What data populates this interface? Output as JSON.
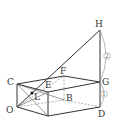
{
  "diagram": {
    "labels": {
      "H": "H",
      "G": "G",
      "D": "D",
      "C": "C",
      "O": "O",
      "E": "E",
      "F": "F",
      "B": "B",
      "L": "L"
    },
    "ratios": {
      "upper": "2",
      "lower": "1"
    }
  }
}
